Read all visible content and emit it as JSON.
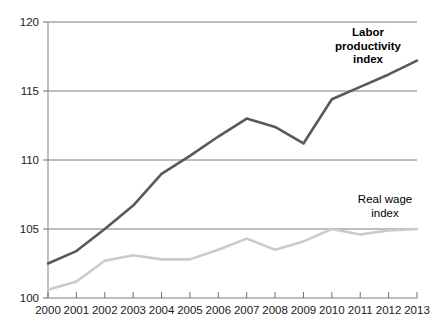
{
  "chart_data": {
    "type": "line",
    "title": "",
    "subtitle": "",
    "xlabel": "",
    "ylabel": "",
    "categories": [
      "2000",
      "2001",
      "2002",
      "2003",
      "2004",
      "2005",
      "2006",
      "2007",
      "2008",
      "2009",
      "2010",
      "2011",
      "2012",
      "2013"
    ],
    "x": [
      2000,
      2001,
      2002,
      2003,
      2004,
      2005,
      2006,
      2007,
      2008,
      2009,
      2010,
      2011,
      2012,
      2013
    ],
    "ylim": [
      100,
      120
    ],
    "yticks": [
      100,
      105,
      110,
      115,
      120
    ],
    "ytick_labels": [
      "100",
      "105",
      "110",
      "115",
      "120"
    ],
    "xtick_labels": [
      "2000",
      "2001",
      "2002",
      "2003",
      "2004",
      "2005",
      "2006",
      "2007",
      "2008",
      "2009",
      "2010",
      "2011",
      "2012",
      "2013"
    ],
    "grid": true,
    "grid_axis": "y",
    "legend_position": "inline-annotations",
    "series": [
      {
        "name": "Labor productivity index",
        "color": "#595959",
        "line_width": 2.6,
        "values": [
          102.5,
          103.4,
          105.0,
          106.7,
          109.0,
          110.3,
          111.7,
          113.0,
          112.4,
          111.2,
          114.4,
          115.3,
          116.2,
          117.2
        ]
      },
      {
        "name": "Real wage index",
        "color": "#cbcbcb",
        "line_width": 2.6,
        "values": [
          100.6,
          101.2,
          102.7,
          103.1,
          102.8,
          102.8,
          103.5,
          104.3,
          103.5,
          104.1,
          105.0,
          104.6,
          104.9,
          105.0
        ]
      }
    ],
    "annotations": [
      {
        "id": "labor-productivity-label",
        "text_lines": [
          "Labor",
          "productivity",
          "index"
        ],
        "bold": true,
        "x_px": 368,
        "y_px": 36
      },
      {
        "id": "real-wage-label",
        "text_lines": [
          "Real wage",
          "index"
        ],
        "bold": false,
        "x_px": 385,
        "y_px": 203
      }
    ],
    "colors": {
      "labor_productivity": "#595959",
      "real_wage": "#cbcbcb",
      "gridline": "#6e6e6e",
      "axis": "#8a8a8a",
      "text": "#1a1a1a",
      "background": "#ffffff"
    }
  },
  "annotation_text": {
    "labor_line1": "Labor",
    "labor_line2": "productivity",
    "labor_line3": "index",
    "wage_line1": "Real wage",
    "wage_line2": "index"
  }
}
